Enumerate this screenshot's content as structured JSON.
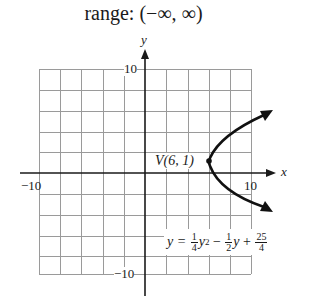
{
  "title": "range: (−∞, ∞)",
  "axes": {
    "x_label": "x",
    "y_label": "y",
    "x_min_label": "−10",
    "x_max_label": "10",
    "y_max_label": "10",
    "y_min_label": "−10"
  },
  "vertex": {
    "label": "V(6, 1)",
    "x": 6,
    "y": 1
  },
  "equation": {
    "lhs": "y =",
    "t1_num": "1",
    "t1_den": "4",
    "t1_var": "y",
    "t1_exp": "2",
    "op1": "−",
    "t2_num": "1",
    "t2_den": "2",
    "t2_var": "y",
    "op2": "+",
    "t3_num": "25",
    "t3_den": "4"
  },
  "grid": {
    "x_range": [
      -10,
      10
    ],
    "y_range": [
      -10,
      10
    ],
    "step": 2
  },
  "colors": {
    "grid": "#9a9a9a",
    "axis": "#1a1a1a",
    "curve": "#111111"
  }
}
